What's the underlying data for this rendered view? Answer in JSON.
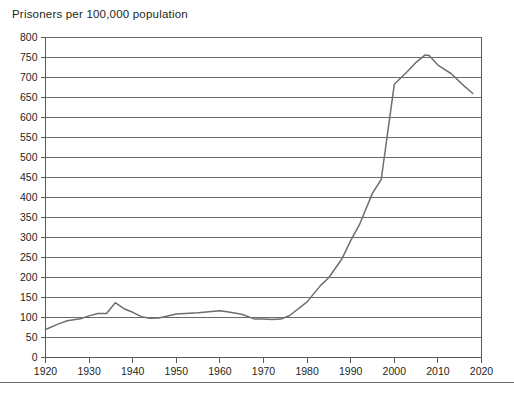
{
  "chart_data": {
    "type": "line",
    "title": "Prisoners per 100,000 population",
    "xlabel": "",
    "ylabel": "",
    "xlim": [
      1920,
      2020
    ],
    "ylim": [
      0,
      800
    ],
    "xticks": [
      1920,
      1930,
      1940,
      1950,
      1960,
      1970,
      1980,
      1990,
      2000,
      2010,
      2020
    ],
    "yticks": [
      0,
      50,
      100,
      150,
      200,
      250,
      300,
      350,
      400,
      450,
      500,
      550,
      600,
      650,
      700,
      750,
      800
    ],
    "grid": "horizontal",
    "legend": "none",
    "line_color": "#6d6e71",
    "grid_color": "#58595b",
    "series": [
      {
        "name": "Prisoners per 100,000 population",
        "x": [
          1920,
          1923,
          1925,
          1928,
          1930,
          1932,
          1934,
          1936,
          1938,
          1940,
          1942,
          1944,
          1946,
          1950,
          1955,
          1960,
          1962,
          1965,
          1968,
          1970,
          1972,
          1974,
          1976,
          1980,
          1983,
          1985,
          1988,
          1990,
          1992,
          1995,
          1997,
          2000,
          2003,
          2005,
          2007,
          2008,
          2010,
          2013,
          2016,
          2018
        ],
        "values": [
          70,
          84,
          92,
          97,
          104,
          110,
          110,
          137,
          122,
          113,
          102,
          98,
          99,
          109,
          112,
          117,
          114,
          108,
          96,
          96,
          95,
          96,
          105,
          139,
          179,
          200,
          247,
          292,
          332,
          411,
          445,
          683,
          715,
          738,
          756,
          755,
          731,
          710,
          679,
          660
        ]
      }
    ],
    "annotations": []
  }
}
